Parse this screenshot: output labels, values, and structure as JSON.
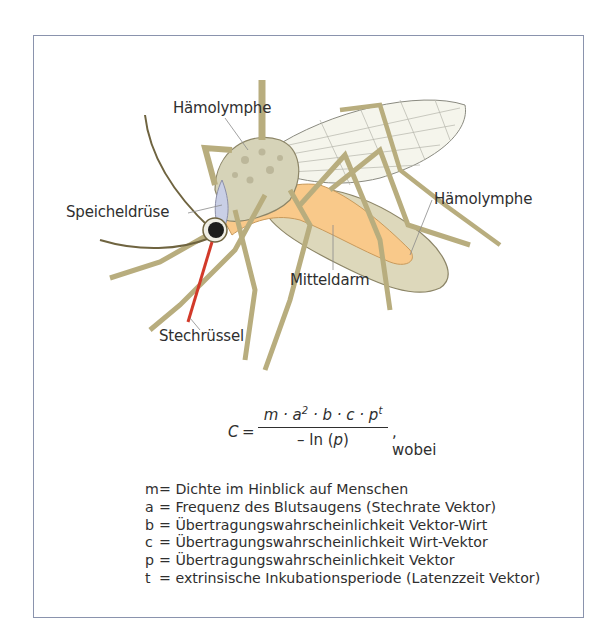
{
  "figure": {
    "labels": {
      "haemolymphe_top": "Hämolymphe",
      "speicheldruese": "Speicheldrüse",
      "haemolymphe_right": "Hämolymphe",
      "mitteldarm": "Mitteldarm",
      "stechruessel": "Stechrüssel"
    },
    "colors": {
      "frame_border": "#8a93ad",
      "leg": "#b8ad7e",
      "leg_outline": "#6f6440",
      "body": "#ddd9bf",
      "midgut": "#f9c98a",
      "salivary_gland": "#c9cfe6",
      "proboscis": "#d23a2a",
      "wing": "#f6f6ee"
    }
  },
  "formula": {
    "lhs": "C",
    "equals": "=",
    "numerator": "m · a",
    "num_sup_a": "2",
    "numerator_rest": " · b · c · p",
    "num_sup_p": "t",
    "denominator_prefix": "– ln (",
    "denominator_var": "p",
    "denominator_suffix": ")",
    "tail": ", wobei"
  },
  "legend": [
    {
      "var": "m",
      "def": "= Dichte im Hinblick auf Menschen"
    },
    {
      "var": "a",
      "def": "= Frequenz des Blutsaugens (Stechrate Vektor)"
    },
    {
      "var": "b",
      "def": "= Übertragungswahrscheinlichkeit Vektor-Wirt"
    },
    {
      "var": "c",
      "def": "= Übertragungswahrscheinlichkeit Wirt-Vektor"
    },
    {
      "var": "p",
      "def": "= Übertragungswahrscheinlichkeit Vektor"
    },
    {
      "var": "t",
      "def": "= extrinsische Inkubationsperiode (Latenzzeit Vektor)"
    }
  ]
}
